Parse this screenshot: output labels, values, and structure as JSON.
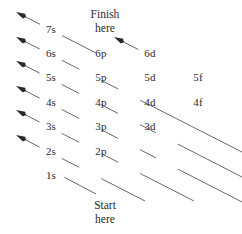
{
  "figure": {
    "title_alt": "Aufbau principle diagonal rule diagram",
    "background_color": "#ffffff",
    "line_color": "#6a6a6a",
    "text_color": "#2b2b2b",
    "arrow_color": "#2b2b2b"
  },
  "captions": {
    "finish_line1": "Finish",
    "finish_line2": "here",
    "start_line1": "Start",
    "start_line2": "here"
  },
  "columns": {
    "s": {
      "label": "s",
      "x": 51
    },
    "p": {
      "label": "p",
      "x": 101
    },
    "d": {
      "label": "d",
      "x": 150
    },
    "f": {
      "label": "f",
      "x": 198
    }
  },
  "orbitals": [
    {
      "name": "7s",
      "shell": 7,
      "subshell": "s",
      "x": 51,
      "y": 30
    },
    {
      "name": "6s",
      "shell": 6,
      "subshell": "s",
      "x": 51,
      "y": 54
    },
    {
      "name": "5s",
      "shell": 5,
      "subshell": "s",
      "x": 51,
      "y": 78
    },
    {
      "name": "4s",
      "shell": 4,
      "subshell": "s",
      "x": 51,
      "y": 103
    },
    {
      "name": "3s",
      "shell": 3,
      "subshell": "s",
      "x": 51,
      "y": 127
    },
    {
      "name": "2s",
      "shell": 2,
      "subshell": "s",
      "x": 51,
      "y": 152
    },
    {
      "name": "1s",
      "shell": 1,
      "subshell": "s",
      "x": 51,
      "y": 176
    },
    {
      "name": "6p",
      "shell": 6,
      "subshell": "p",
      "x": 101,
      "y": 54
    },
    {
      "name": "5p",
      "shell": 5,
      "subshell": "p",
      "x": 101,
      "y": 78
    },
    {
      "name": "4p",
      "shell": 4,
      "subshell": "p",
      "x": 101,
      "y": 103
    },
    {
      "name": "3p",
      "shell": 3,
      "subshell": "p",
      "x": 101,
      "y": 127
    },
    {
      "name": "2p",
      "shell": 2,
      "subshell": "p",
      "x": 101,
      "y": 152
    },
    {
      "name": "6d",
      "shell": 6,
      "subshell": "d",
      "x": 150,
      "y": 54
    },
    {
      "name": "5d",
      "shell": 5,
      "subshell": "d",
      "x": 150,
      "y": 78
    },
    {
      "name": "4d",
      "shell": 4,
      "subshell": "d",
      "x": 150,
      "y": 103
    },
    {
      "name": "3d",
      "shell": 3,
      "subshell": "d",
      "x": 150,
      "y": 127
    },
    {
      "name": "5f",
      "shell": 5,
      "subshell": "f",
      "x": 198,
      "y": 78
    },
    {
      "name": "4f",
      "shell": 4,
      "subshell": "f",
      "x": 198,
      "y": 103
    }
  ],
  "arrows": [
    {
      "id": "arrow-7s",
      "sequence": [
        "7s"
      ],
      "tip_x": 16,
      "tip_y": 12,
      "tail_x": 96,
      "tail_y": 53,
      "has_head": true
    },
    {
      "id": "arrow-6s",
      "sequence": [
        "6s",
        "6p",
        "6d"
      ],
      "tip_x": 16,
      "tip_y": 37,
      "tail_x": 242,
      "tail_y": 152,
      "has_head": true
    },
    {
      "id": "arrow-5s",
      "sequence": [
        "5s",
        "5p",
        "5d",
        "5f"
      ],
      "tip_x": 16,
      "tip_y": 61,
      "tail_x": 242,
      "tail_y": 177,
      "has_head": true
    },
    {
      "id": "arrow-4s",
      "sequence": [
        "4s",
        "4p",
        "4d",
        "4f"
      ],
      "tip_x": 16,
      "tip_y": 86,
      "tail_x": 242,
      "tail_y": 202,
      "has_head": true
    },
    {
      "id": "arrow-3s",
      "sequence": [
        "3s",
        "3p",
        "3d"
      ],
      "tip_x": 16,
      "tip_y": 110,
      "tail_x": 194,
      "tail_y": 201,
      "has_head": true
    },
    {
      "id": "arrow-2s",
      "sequence": [
        "2s",
        "2p"
      ],
      "tip_x": 16,
      "tip_y": 135,
      "tail_x": 145,
      "tail_y": 201,
      "has_head": true
    },
    {
      "id": "arrow-1s",
      "sequence": [
        "1s"
      ],
      "tip_x": 62,
      "tip_y": 176,
      "tail_x": 96,
      "tail_y": 194,
      "has_head": false
    },
    {
      "id": "arrow-6d-branch",
      "sequence": [
        "6d"
      ],
      "tip_x": 114,
      "tip_y": 37,
      "tail_x": 145,
      "tail_y": 53,
      "has_head": true
    }
  ],
  "filling_order": [
    "1s",
    "2s",
    "2p",
    "3s",
    "3p",
    "4s",
    "3d",
    "4p",
    "5s",
    "4d",
    "5p",
    "6s",
    "4f",
    "5d",
    "6p",
    "7s",
    "5f",
    "6d"
  ]
}
